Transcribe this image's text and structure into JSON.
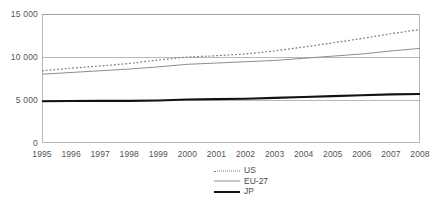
{
  "chart_data": {
    "type": "line",
    "title": "",
    "subtitle": "",
    "xlabel": "",
    "ylabel": "",
    "x": [
      1995,
      1996,
      1997,
      1998,
      1999,
      2000,
      2001,
      2002,
      2003,
      2004,
      2005,
      2006,
      2007,
      2008
    ],
    "categories": [
      "1995",
      "1996",
      "1997",
      "1998",
      "1999",
      "2000",
      "2001",
      "2002",
      "2003",
      "2004",
      "2005",
      "2006",
      "2007",
      "2008"
    ],
    "series": [
      {
        "name": "US",
        "style": "dotted",
        "color": "#7a7a7a",
        "values": [
          8400,
          8700,
          8950,
          9250,
          9650,
          10000,
          10150,
          10350,
          10700,
          11150,
          11650,
          12150,
          12700,
          13200
        ]
      },
      {
        "name": "EU-27",
        "style": "solid",
        "color": "#8d8d8d",
        "values": [
          8000,
          8200,
          8400,
          8600,
          8850,
          9150,
          9300,
          9450,
          9600,
          9850,
          10100,
          10350,
          10700,
          11000
        ]
      },
      {
        "name": "JP",
        "style": "bold-solid",
        "color": "#121212",
        "values": [
          4850,
          4880,
          4900,
          4900,
          4950,
          5050,
          5100,
          5150,
          5250,
          5350,
          5450,
          5550,
          5650,
          5700
        ]
      }
    ],
    "ylim": [
      0,
      15000
    ],
    "yticks": [
      0,
      5000,
      10000,
      15000
    ],
    "ytick_labels": [
      "0",
      "5 000",
      "10 000",
      "15 000"
    ],
    "xlim": [
      1995,
      2008
    ],
    "grid": "horizontal",
    "legend_position": "bottom-center",
    "legend_entries": [
      {
        "label": "US",
        "key": "dotted"
      },
      {
        "label": "EU-27",
        "key": "solid"
      },
      {
        "label": "JP",
        "key": "bold-solid"
      }
    ],
    "colors": {
      "us": "#7a7a7a",
      "eu": "#8d8d8d",
      "jp": "#121212",
      "axis": "#9a9a9a",
      "grid": "#9a9a9a",
      "text": "#555555"
    }
  },
  "footnote": {
    "text": ""
  }
}
